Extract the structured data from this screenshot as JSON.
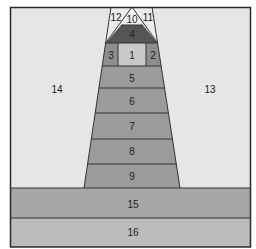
{
  "diagram": {
    "colors": {
      "frame": "#2b2b2b",
      "side_regions": "#e6e6e6",
      "top_triangles": "#ececec",
      "region_4": "#555555",
      "cell_1": "#c9c9c9",
      "cells_2_3": "#8e8e8e",
      "tower_bands": "#9b9b9b",
      "band_15": "#a6a6a6",
      "band_16": "#bcbcbc"
    },
    "regions": {
      "r1": "1",
      "r2": "2",
      "r3": "3",
      "r4": "4",
      "r5": "5",
      "r6": "6",
      "r7": "7",
      "r8": "8",
      "r9": "9",
      "r10": "10",
      "r11": "11",
      "r12": "12",
      "r13": "13",
      "r14": "14",
      "r15": "15",
      "r16": "16"
    }
  }
}
